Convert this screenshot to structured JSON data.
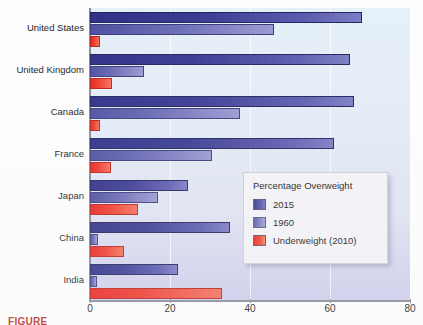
{
  "chart_data": {
    "type": "bar",
    "orientation": "horizontal",
    "title": "",
    "xlabel": "",
    "ylabel": "",
    "xlim": [
      0,
      80
    ],
    "xticks": [
      0,
      20,
      40,
      60,
      80
    ],
    "grid": true,
    "legend_position": "inside-right-lower",
    "categories": [
      "United States",
      "United Kingdom",
      "Canada",
      "France",
      "Japan",
      "China",
      "India"
    ],
    "series": [
      {
        "name": "2015",
        "color": "#34348c",
        "values": [
          68,
          65,
          66,
          61,
          24.5,
          35,
          22
        ]
      },
      {
        "name": "1960",
        "color": "#7a7ac2",
        "values": [
          46,
          13.5,
          37.5,
          30.5,
          17,
          2,
          1.8
        ]
      },
      {
        "name": "Underweight (2010)",
        "color": "#ef3b2c",
        "values": [
          2.5,
          5.5,
          2.5,
          5.2,
          12,
          8.5,
          33
        ]
      }
    ]
  },
  "legend": {
    "title": "Percentage Overweight",
    "entries": [
      {
        "label": "2015",
        "swatch": "s2015"
      },
      {
        "label": "1960",
        "swatch": "s1960"
      },
      {
        "label": "Underweight (2010)",
        "swatch": "under"
      }
    ]
  },
  "axis": {
    "x_tick_labels": [
      "0",
      "20",
      "40",
      "60",
      "80"
    ],
    "y_tick_labels": [
      "United States",
      "United Kingdom",
      "Canada",
      "France",
      "Japan",
      "China",
      "India"
    ]
  },
  "caption": {
    "text": "FIGURE"
  },
  "colors": {
    "series_2015": "#34348c",
    "series_1960": "#7a7ac2",
    "series_underweight": "#ef3b2c",
    "plot_background_top": "#e6f0f8",
    "plot_background_bottom": "#ccccea",
    "legend_background": "#f3f2f5",
    "axis_line": "#8a8a99"
  }
}
